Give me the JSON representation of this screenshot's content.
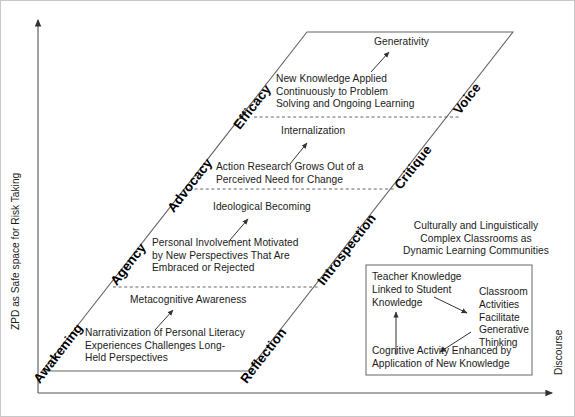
{
  "axes": {
    "y_label": "ZPD as Safe space for Risk Taking",
    "x_label": "Discourse"
  },
  "stage_labels": {
    "left_lower": "Awakening",
    "left_mid_lower": "Agency",
    "left_mid_upper": "Advocacy",
    "left_upper": "Efficacy",
    "right_lower": "Reflection",
    "right_mid_lower": "Introspection",
    "right_mid_upper": "Critique",
    "right_upper": "Voice"
  },
  "bands": {
    "band4_outcome": "Generativity",
    "band4_body": "New Knowledge Applied\nContinuously to Problem\nSolving and Ongoing Learning",
    "band3_outcome": "Internalization",
    "band3_body": "Action Research Grows Out of a\nPerceived Need for Change",
    "band2_outcome": "Ideological Becoming",
    "band2_body": "Personal Involvement Motivated\nby New Perspectives That Are\nEmbraced or Rejected",
    "band1_outcome": "Metacognitive Awareness",
    "band1_body": "Narrativization of Personal Literacy\nExperiences Challenges Long-\nHeld Perspectives"
  },
  "right_region": {
    "heading": "Culturally and Linguistically\nComplex Classrooms as\nDynamic Learning Communities"
  },
  "inner_box": {
    "teacher_knowledge": "Teacher Knowledge\nLinked to Student\nKnowledge",
    "classroom_activities": "Classroom\nActivities\nFacilitate\nGenerative\nThinking",
    "cognitive_activity": "Cognitive Activity Enhanced by\nApplication of New Knowledge"
  },
  "colors": {
    "stroke": "#555555",
    "text": "#1a1a1a",
    "background": "#ffffff",
    "frame": "#aaaaaa"
  }
}
